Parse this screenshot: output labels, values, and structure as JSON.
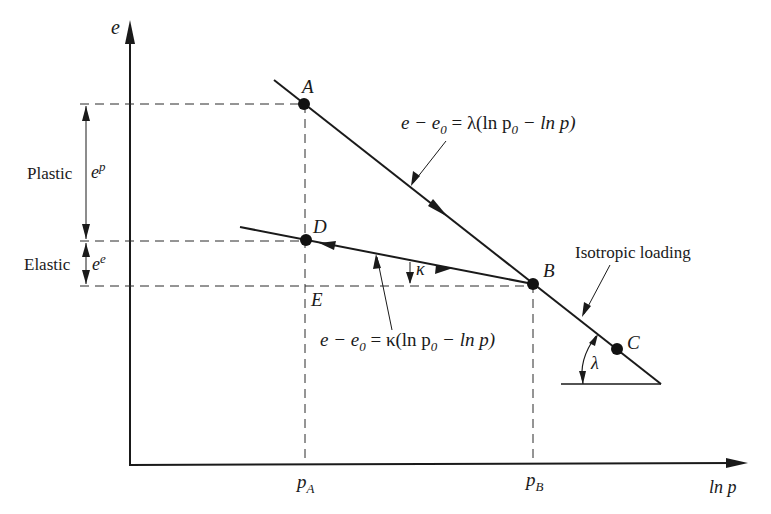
{
  "axes": {
    "y_label": "e",
    "x_label": "ln p",
    "x_ticks": [
      {
        "main": "p",
        "sub": "A"
      },
      {
        "main": "p",
        "sub": "B"
      }
    ]
  },
  "points": [
    {
      "id": "A",
      "label": "A"
    },
    {
      "id": "B",
      "label": "B"
    },
    {
      "id": "C",
      "label": "C"
    },
    {
      "id": "D",
      "label": "D"
    },
    {
      "id": "E",
      "label": "E"
    }
  ],
  "dimensions": {
    "plastic": {
      "label": "Plastic",
      "symbol": "e",
      "superscript": "p"
    },
    "elastic": {
      "label": "Elastic",
      "symbol": "e",
      "superscript": "e"
    }
  },
  "equations": {
    "ncl": {
      "lhs": "e − e",
      "lhs_sub": "0",
      "mid": " = λ(ln p",
      "mid_sub": "0",
      "rhs": " − ln p)"
    },
    "url": {
      "lhs": "e − e",
      "lhs_sub": "0",
      "mid": " = κ(ln p",
      "mid_sub": "0",
      "rhs": " − ln p)"
    }
  },
  "annotations": {
    "isotropic_loading": "Isotropic loading",
    "lambda_symbol": "λ",
    "kappa_symbol": "κ"
  }
}
